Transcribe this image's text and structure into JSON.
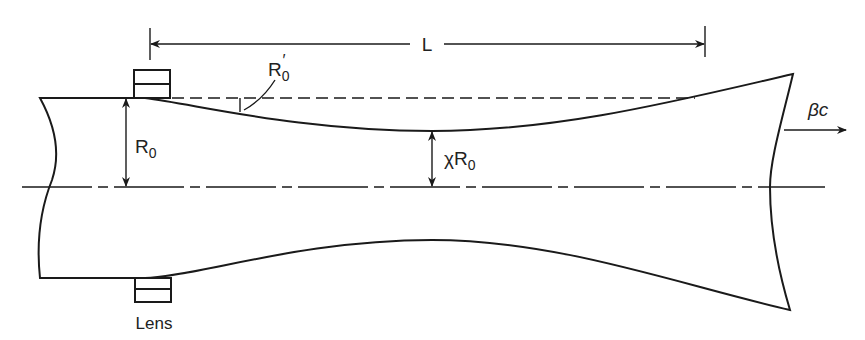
{
  "diagram": {
    "labels": {
      "length": "L",
      "initial_radius": "R",
      "initial_radius_sub": "0",
      "slope": "R",
      "slope_sub": "0",
      "slope_prime": "′",
      "waist_prefix": "χR",
      "waist_sub": "0",
      "velocity": "βc",
      "lens": "Lens"
    },
    "colors": {
      "stroke": "#1a1a1a",
      "background": "#ffffff"
    }
  }
}
